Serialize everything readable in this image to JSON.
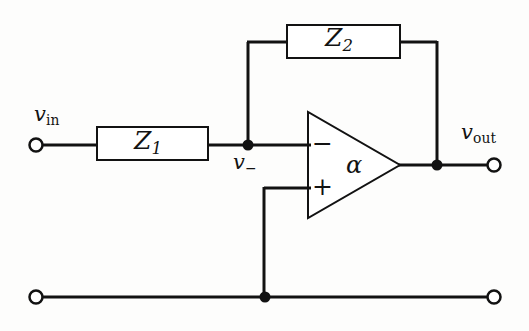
{
  "figure": {
    "kind": "circuit-schematic",
    "background_color": "#fdfdfc",
    "line_color": "#121212",
    "line_width": 3
  },
  "labels": {
    "v_in": {
      "base": "v",
      "sub": "in"
    },
    "v_out": {
      "base": "v",
      "sub": "out"
    },
    "v_minus": {
      "base": "v",
      "sub": "−"
    },
    "z1": {
      "base": "Z",
      "sub": "1"
    },
    "z2": {
      "base": "Z",
      "sub": "2"
    },
    "gain": "α",
    "inverting_input": "−",
    "noninverting_input": "+"
  },
  "components": {
    "z1_box": {
      "label": "Z1",
      "x": 97,
      "y": 127,
      "width": 111,
      "height": 33
    },
    "z2_box": {
      "label": "Z2",
      "x": 287,
      "y": 25,
      "width": 113,
      "height": 33
    },
    "opamp": {
      "label": "α",
      "apex_x": 400,
      "apex_y": 165,
      "left_x": 308,
      "top_y": 112,
      "bottom_y": 218,
      "inverting_input_y": 145,
      "noninverting_input_y": 188
    }
  },
  "terminals": [
    {
      "name": "input-terminal",
      "x": 36,
      "y": 145,
      "r": 6
    },
    {
      "name": "output-terminal",
      "x": 494,
      "y": 165,
      "r": 6
    },
    {
      "name": "ground-left-terminal",
      "x": 36,
      "y": 297,
      "r": 6
    },
    {
      "name": "ground-right-terminal",
      "x": 494,
      "y": 297,
      "r": 6
    }
  ],
  "junctions": [
    {
      "name": "v-minus-node",
      "x": 248,
      "y": 145,
      "r": 5
    },
    {
      "name": "output-node",
      "x": 437,
      "y": 165,
      "r": 5
    },
    {
      "name": "ground-node",
      "x": 265,
      "y": 297,
      "r": 5
    }
  ],
  "wires": [
    {
      "name": "input-to-z1",
      "points": "42,145 97,145"
    },
    {
      "name": "z1-to-node",
      "points": "208,145 248,145"
    },
    {
      "name": "node-to-inverting-input",
      "points": "248,145 308,145"
    },
    {
      "name": "feedback-left-vertical",
      "points": "248,145 248,42"
    },
    {
      "name": "feedback-left-horizontal",
      "points": "248,42 287,42"
    },
    {
      "name": "feedback-right-horizontal",
      "points": "400,42 437,42"
    },
    {
      "name": "feedback-right-vertical",
      "points": "437,42 437,165"
    },
    {
      "name": "opamp-output-wire",
      "points": "400,165 494,165"
    },
    {
      "name": "noninverting-input-horizontal",
      "points": "308,188 264,188"
    },
    {
      "name": "noninverting-input-vertical",
      "points": "264,188 264,297"
    },
    {
      "name": "ground-rail",
      "points": "42,297 494,297"
    }
  ]
}
